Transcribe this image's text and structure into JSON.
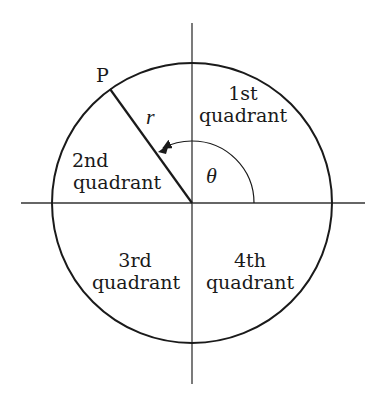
{
  "diagram": {
    "colors": {
      "background": "#ffffff",
      "stroke": "#1a1a1a",
      "axis": "#333333"
    },
    "geometry": {
      "center": [
        192,
        203
      ],
      "circle_radius": 140,
      "angle_arc_radius": 62,
      "theta_degrees": 126,
      "axis_x_extent": [
        21,
        365
      ],
      "axis_y_extent": [
        23,
        384
      ]
    },
    "point": {
      "label": "P"
    },
    "radius_label": "r",
    "angle_label": "θ",
    "quadrants": [
      {
        "line1": "1st",
        "line2": "quadrant"
      },
      {
        "line1": "2nd",
        "line2": "quadrant"
      },
      {
        "line1": "3rd",
        "line2": "quadrant"
      },
      {
        "line1": "4th",
        "line2": "quadrant"
      }
    ]
  }
}
